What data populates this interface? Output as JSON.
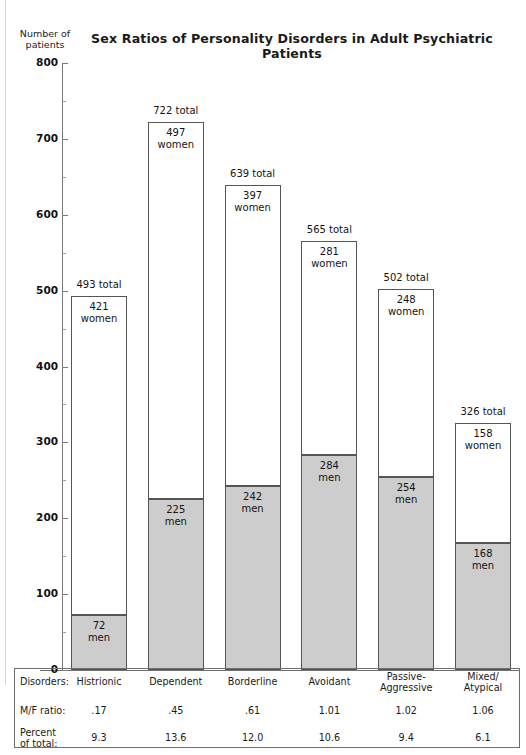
{
  "chart_data": {
    "type": "bar",
    "subtype": "stacked-vertical",
    "title": "Sex Ratios of Personality Disorders in Adult Psychiatric Patients",
    "xlabel": "Disorders:",
    "ylabel": "Number of patients",
    "ylim": [
      0,
      800
    ],
    "yticks": [
      0,
      100,
      200,
      300,
      400,
      500,
      600,
      700,
      800
    ],
    "ytick_labels": [
      "0",
      "100",
      "200",
      "300",
      "400",
      "500",
      "600",
      "700",
      "800"
    ],
    "minor_tick_interval": 50,
    "grid": false,
    "legend": "none",
    "categories": [
      "Histrionic",
      "Dependent",
      "Borderline",
      "Avoidant",
      "Passive-Aggressive",
      "Mixed/Atypical"
    ],
    "series": [
      {
        "name": "men",
        "values": [
          72,
          225,
          242,
          284,
          254,
          168
        ],
        "color": "#cdcdcd",
        "stack_position": "bottom"
      },
      {
        "name": "women",
        "values": [
          421,
          497,
          397,
          281,
          248,
          158
        ],
        "color": "#ffffff",
        "stack_position": "top"
      }
    ],
    "totals": [
      493,
      722,
      639,
      565,
      502,
      326
    ],
    "annotations": {
      "total_suffix": "total",
      "men_label": "men",
      "women_label": "women"
    }
  },
  "header": {
    "title": "Sex Ratios of Personality Disorders in Adult Psychiatric Patients",
    "axis_caption_line1": "Number of",
    "axis_caption_line2": "patients"
  },
  "yaxis": {
    "labels": [
      "800",
      "700",
      "600",
      "500",
      "400",
      "300",
      "200",
      "100",
      "0"
    ]
  },
  "bars": [
    {
      "category": "Histrionic",
      "total_label": "493 total",
      "women_value": "421",
      "women_label": "women",
      "men_value": "72",
      "men_label": "men"
    },
    {
      "category": "Dependent",
      "total_label": "722 total",
      "women_value": "497",
      "women_label": "women",
      "men_value": "225",
      "men_label": "men"
    },
    {
      "category": "Borderline",
      "total_label": "639 total",
      "women_value": "397",
      "women_label": "women",
      "men_value": "242",
      "men_label": "men"
    },
    {
      "category": "Avoidant",
      "total_label": "565 total",
      "women_value": "281",
      "women_label": "women",
      "men_value": "284",
      "men_label": "men"
    },
    {
      "category": "Passive-Aggressive",
      "total_label": "502 total",
      "women_value": "248",
      "women_label": "women",
      "men_value": "254",
      "men_label": "men"
    },
    {
      "category": "Mixed/Atypical",
      "total_label": "326 total",
      "women_value": "158",
      "women_label": "women",
      "men_value": "168",
      "men_label": "men"
    }
  ],
  "table": {
    "row_labels": {
      "disorders": "Disorders:",
      "ratio": "M/F ratio:",
      "percent_line1": "Percent",
      "percent_line2": "of total:"
    },
    "disorders": [
      {
        "line1": "Histrionic",
        "line2": ""
      },
      {
        "line1": "Dependent",
        "line2": ""
      },
      {
        "line1": "Borderline",
        "line2": ""
      },
      {
        "line1": "Avoidant",
        "line2": ""
      },
      {
        "line1": "Passive-",
        "line2": "Aggressive"
      },
      {
        "line1": "Mixed/",
        "line2": "Atypical"
      }
    ],
    "mf_ratio": [
      ".17",
      ".45",
      ".61",
      "1.01",
      "1.02",
      "1.06"
    ],
    "percent_of_total": [
      "9.3",
      "13.6",
      "12.0",
      "10.6",
      "9.4",
      "6.1"
    ]
  },
  "colors": {
    "men_fill": "#cdcdcd",
    "women_fill": "#ffffff",
    "bar_stroke": "#555555",
    "axis": "#7a7a7a",
    "text": "#1a1a1a"
  }
}
